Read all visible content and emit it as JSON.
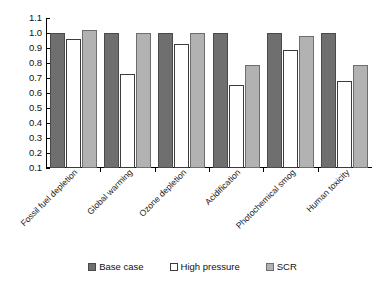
{
  "chart_data": {
    "type": "bar",
    "title": "",
    "subtitle": "",
    "xlabel": "",
    "ylabel": "",
    "ylim": [
      0.1,
      1.1
    ],
    "yticks": [
      "1.1",
      "1.0",
      "0.9",
      "0.8",
      "0.7",
      "0.6",
      "0.5",
      "0.4",
      "0.3",
      "0.2",
      "0.1"
    ],
    "ytick_values": [
      1.1,
      1.0,
      0.9,
      0.8,
      0.7,
      0.6,
      0.5,
      0.4,
      0.3,
      0.2,
      0.1
    ],
    "grid": false,
    "legend_position": "bottom-center",
    "categories": [
      "Fossil fuel depletion",
      "Global warming",
      "Ozone depletion",
      "Acidification",
      "Photochemical smog",
      "Human toxicity"
    ],
    "series": [
      {
        "name": "Base case",
        "color": "#6f6f6f",
        "values": [
          1.0,
          1.0,
          1.0,
          1.0,
          1.0,
          1.0
        ]
      },
      {
        "name": "High pressure",
        "color": "#ffffff",
        "values": [
          0.96,
          0.73,
          0.93,
          0.655,
          0.885,
          0.68
        ]
      },
      {
        "name": "SCR",
        "color": "#b2b2b2",
        "values": [
          1.02,
          1.0,
          1.0,
          0.79,
          0.98,
          0.79
        ]
      }
    ]
  },
  "legend": {
    "items": [
      {
        "label": "Base case",
        "swatch": "base-case-swatch"
      },
      {
        "label": "High pressure",
        "swatch": "high-pressure-swatch"
      },
      {
        "label": "SCR",
        "swatch": "scr-swatch"
      }
    ]
  }
}
